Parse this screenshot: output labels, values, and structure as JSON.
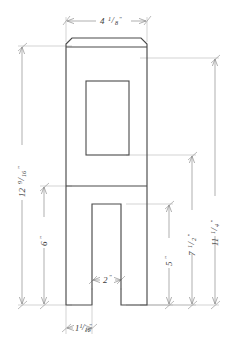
{
  "drawing": {
    "title": "Dimensioned part elevation drawing",
    "units": "inches",
    "line_color": "#4a4a4a",
    "dim_line_color": "#8c8c8c",
    "text_color": "#3b3b3b",
    "background": "#ffffff",
    "dimensions": {
      "top_width": {
        "label": "4 1/8\"",
        "whole": "4",
        "numerator": "1",
        "denominator": "8",
        "unit": "\"",
        "orientation": "horizontal",
        "position": "top"
      },
      "overall_height_left": {
        "label": "12 9/16\"",
        "whole": "12",
        "numerator": "9",
        "denominator": "16",
        "unit": "\"",
        "orientation": "vertical",
        "position": "left-outer"
      },
      "lower_height_left": {
        "label": "6\"",
        "whole": "6",
        "numerator": "",
        "denominator": "",
        "unit": "\"",
        "orientation": "vertical",
        "position": "left-inner"
      },
      "slot_width": {
        "label": "2\"",
        "whole": "2",
        "numerator": "",
        "denominator": "",
        "unit": "\"",
        "orientation": "horizontal",
        "position": "bottom-slot"
      },
      "leg_width": {
        "label": "1 1/16\"",
        "whole": "1",
        "numerator": "1",
        "denominator": "16",
        "unit": "\"",
        "orientation": "horizontal",
        "position": "bottom-left-leg"
      },
      "right_outer_height": {
        "label": "11 1/4\"",
        "whole": "11",
        "numerator": "1",
        "denominator": "4",
        "unit": "\"",
        "orientation": "vertical",
        "position": "right-outer"
      },
      "right_middle_height": {
        "label": "7 1/2\"",
        "whole": "7",
        "numerator": "1",
        "denominator": "2",
        "unit": "\"",
        "orientation": "vertical",
        "position": "right-middle"
      },
      "right_inner_height": {
        "label": "5\"",
        "whole": "5",
        "numerator": "",
        "denominator": "",
        "unit": "\"",
        "orientation": "vertical",
        "position": "right-inner"
      }
    },
    "geometry_notes": {
      "outline": "Tall rectangular body with chamfered top corners, a band below the top, a rectangular cut-out window in the upper body, a horizontal crossbar, and two legs forming a slot at the bottom.",
      "features": [
        "chamfered-top-cap",
        "top-band-line",
        "upper-window-cutout",
        "mid-crossbar",
        "bottom-slot",
        "left-leg",
        "right-leg"
      ]
    }
  }
}
